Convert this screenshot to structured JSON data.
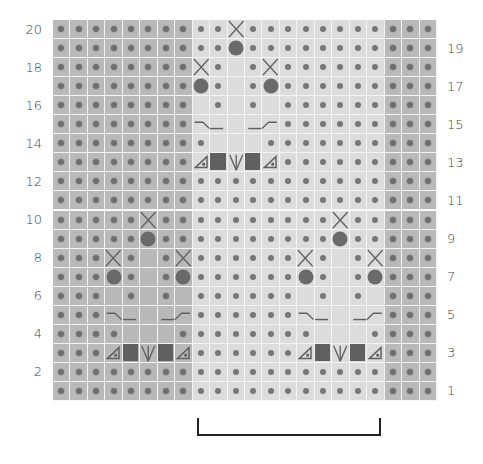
{
  "chart": {
    "columns": 22,
    "rows": 20,
    "panel_columns": {
      "dark_left": [
        0,
        7
      ],
      "light_center": [
        8,
        18
      ],
      "dark_right": [
        19,
        21
      ]
    },
    "colors": {
      "dark_bg": "#b9b9b9",
      "light_bg": "#dcdcdc",
      "symbol": "#606060",
      "gridline": "#f4f4f4"
    },
    "legend_symbols": {
      "d": "purl-dot",
      "": "knit-blank",
      "x": "cross",
      "o": "bobble",
      "t": "triangle-with-dot",
      "s": "solid-square",
      "v": "v-arrow-decrease",
      "l": "left-cable-line",
      "r": "right-cable-line"
    },
    "grid_top_to_bottom": [
      {
        "row": 20,
        "cells": [
          "d",
          "d",
          "d",
          "d",
          "d",
          "d",
          "d",
          "d",
          "d",
          "d",
          "x",
          "d",
          "d",
          "d",
          "d",
          "d",
          "d",
          "d",
          "d",
          "d",
          "d",
          "d"
        ]
      },
      {
        "row": 19,
        "cells": [
          "d",
          "d",
          "d",
          "d",
          "d",
          "d",
          "d",
          "d",
          "d",
          "d",
          "o",
          "d",
          "d",
          "d",
          "d",
          "d",
          "d",
          "d",
          "d",
          "d",
          "d",
          "d"
        ]
      },
      {
        "row": 18,
        "cells": [
          "d",
          "d",
          "d",
          "d",
          "d",
          "d",
          "d",
          "d",
          "x",
          "d",
          "",
          "d",
          "x",
          "d",
          "d",
          "d",
          "d",
          "d",
          "d",
          "d",
          "d",
          "d"
        ]
      },
      {
        "row": 17,
        "cells": [
          "d",
          "d",
          "d",
          "d",
          "d",
          "d",
          "d",
          "d",
          "o",
          "d",
          "",
          "d",
          "o",
          "d",
          "d",
          "d",
          "d",
          "d",
          "d",
          "d",
          "d",
          "d"
        ]
      },
      {
        "row": 16,
        "cells": [
          "d",
          "d",
          "d",
          "d",
          "d",
          "d",
          "d",
          "d",
          "",
          "d",
          "",
          "d",
          "",
          "d",
          "d",
          "d",
          "d",
          "d",
          "d",
          "d",
          "d",
          "d"
        ]
      },
      {
        "row": 15,
        "cells": [
          "d",
          "d",
          "d",
          "d",
          "d",
          "d",
          "d",
          "d",
          "l",
          "l",
          "",
          "r",
          "r",
          "d",
          "d",
          "d",
          "d",
          "d",
          "d",
          "d",
          "d",
          "d"
        ]
      },
      {
        "row": 14,
        "cells": [
          "d",
          "d",
          "d",
          "d",
          "d",
          "d",
          "d",
          "d",
          "d",
          "",
          "",
          "",
          "d",
          "d",
          "d",
          "d",
          "d",
          "d",
          "d",
          "d",
          "d",
          "d"
        ]
      },
      {
        "row": 13,
        "cells": [
          "d",
          "d",
          "d",
          "d",
          "d",
          "d",
          "d",
          "d",
          "t",
          "s",
          "v",
          "s",
          "t",
          "d",
          "d",
          "d",
          "d",
          "d",
          "d",
          "d",
          "d",
          "d"
        ]
      },
      {
        "row": 12,
        "cells": [
          "d",
          "d",
          "d",
          "d",
          "d",
          "d",
          "d",
          "d",
          "d",
          "d",
          "d",
          "d",
          "d",
          "d",
          "d",
          "d",
          "d",
          "d",
          "d",
          "d",
          "d",
          "d"
        ]
      },
      {
        "row": 11,
        "cells": [
          "d",
          "d",
          "d",
          "d",
          "d",
          "d",
          "d",
          "d",
          "d",
          "d",
          "d",
          "d",
          "d",
          "d",
          "d",
          "d",
          "d",
          "d",
          "d",
          "d",
          "d",
          "d"
        ]
      },
      {
        "row": 10,
        "cells": [
          "d",
          "d",
          "d",
          "d",
          "d",
          "x",
          "d",
          "d",
          "d",
          "d",
          "d",
          "d",
          "d",
          "d",
          "d",
          "d",
          "x",
          "d",
          "d",
          "d",
          "d",
          "d"
        ]
      },
      {
        "row": 9,
        "cells": [
          "d",
          "d",
          "d",
          "d",
          "d",
          "o",
          "d",
          "d",
          "d",
          "d",
          "d",
          "d",
          "d",
          "d",
          "d",
          "d",
          "o",
          "d",
          "d",
          "d",
          "d",
          "d"
        ]
      },
      {
        "row": 8,
        "cells": [
          "d",
          "d",
          "d",
          "x",
          "d",
          "",
          "d",
          "x",
          "d",
          "d",
          "d",
          "d",
          "d",
          "d",
          "x",
          "d",
          "",
          "d",
          "x",
          "d",
          "d",
          "d"
        ]
      },
      {
        "row": 7,
        "cells": [
          "d",
          "d",
          "d",
          "o",
          "d",
          "",
          "d",
          "o",
          "d",
          "d",
          "d",
          "d",
          "d",
          "d",
          "o",
          "d",
          "",
          "d",
          "o",
          "d",
          "d",
          "d"
        ]
      },
      {
        "row": 6,
        "cells": [
          "d",
          "d",
          "d",
          "",
          "d",
          "",
          "d",
          "",
          "d",
          "d",
          "d",
          "d",
          "d",
          "d",
          "",
          "d",
          "",
          "d",
          "",
          "d",
          "d",
          "d"
        ]
      },
      {
        "row": 5,
        "cells": [
          "d",
          "d",
          "d",
          "l",
          "l",
          "",
          "r",
          "r",
          "d",
          "d",
          "d",
          "d",
          "d",
          "d",
          "l",
          "l",
          "",
          "r",
          "r",
          "d",
          "d",
          "d"
        ]
      },
      {
        "row": 4,
        "cells": [
          "d",
          "d",
          "d",
          "d",
          "",
          "",
          "",
          "d",
          "d",
          "d",
          "d",
          "d",
          "d",
          "d",
          "d",
          "",
          "",
          "",
          "d",
          "d",
          "d",
          "d"
        ]
      },
      {
        "row": 3,
        "cells": [
          "d",
          "d",
          "d",
          "t",
          "s",
          "v",
          "s",
          "t",
          "d",
          "d",
          "d",
          "d",
          "d",
          "d",
          "t",
          "s",
          "v",
          "s",
          "t",
          "d",
          "d",
          "d"
        ]
      },
      {
        "row": 2,
        "cells": [
          "d",
          "d",
          "d",
          "d",
          "d",
          "d",
          "d",
          "d",
          "d",
          "d",
          "d",
          "d",
          "d",
          "d",
          "d",
          "d",
          "d",
          "d",
          "d",
          "d",
          "d",
          "d"
        ]
      },
      {
        "row": 1,
        "cells": [
          "d",
          "d",
          "d",
          "d",
          "d",
          "d",
          "d",
          "d",
          "d",
          "d",
          "d",
          "d",
          "d",
          "d",
          "d",
          "d",
          "d",
          "d",
          "d",
          "d",
          "d",
          "d"
        ]
      }
    ],
    "row_labels_left": [
      "20",
      "18",
      "16",
      "14",
      "12",
      "10",
      "8",
      "6",
      "4",
      "2"
    ],
    "row_labels_right": [
      "19",
      "17",
      "15",
      "13",
      "11",
      "9",
      "7",
      "5",
      "3",
      "1"
    ],
    "repeat_bracket": {
      "from_col": 8,
      "to_col": 18
    }
  }
}
